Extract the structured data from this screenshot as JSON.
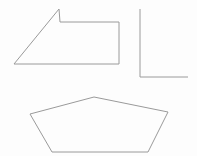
{
  "canvas": {
    "width": 197,
    "height": 156,
    "background_color": "#fdfdfd",
    "stroke_color": "#9a9a9a",
    "fill_color": "none",
    "stroke_width": 1
  },
  "figure": {
    "title": "",
    "shape_count": 3
  },
  "shapes": [
    {
      "id": "shape-1",
      "name": "notched-quadrilateral",
      "label": "",
      "vertex_count": 6,
      "points": "14,64 59,9 60,22 119,22 119,64 14,64",
      "vertices": [
        {
          "x": 14,
          "y": 64
        },
        {
          "x": 59,
          "y": 9
        },
        {
          "x": 60,
          "y": 22
        },
        {
          "x": 119,
          "y": 22
        },
        {
          "x": 119,
          "y": 64
        },
        {
          "x": 14,
          "y": 64
        }
      ],
      "bbox": {
        "x": 14,
        "y": 9,
        "width": 105,
        "height": 55
      },
      "position": "top-left"
    },
    {
      "id": "shape-2",
      "name": "right-triangle",
      "label": "",
      "vertex_count": 3,
      "points": "140,9 140,77 188,77",
      "vertices": [
        {
          "x": 140,
          "y": 9
        },
        {
          "x": 140,
          "y": 77
        },
        {
          "x": 188,
          "y": 77
        }
      ],
      "bbox": {
        "x": 140,
        "y": 9,
        "width": 48,
        "height": 68
      },
      "position": "top-right"
    },
    {
      "id": "shape-3",
      "name": "pentagon",
      "label": "",
      "vertex_count": 5,
      "points": "94,97 168,112 148,152 52,152 30,114",
      "vertices": [
        {
          "x": 94,
          "y": 97
        },
        {
          "x": 168,
          "y": 112
        },
        {
          "x": 148,
          "y": 152
        },
        {
          "x": 52,
          "y": 152
        },
        {
          "x": 30,
          "y": 114
        }
      ],
      "bbox": {
        "x": 30,
        "y": 97,
        "width": 138,
        "height": 55
      },
      "position": "bottom-center"
    }
  ]
}
